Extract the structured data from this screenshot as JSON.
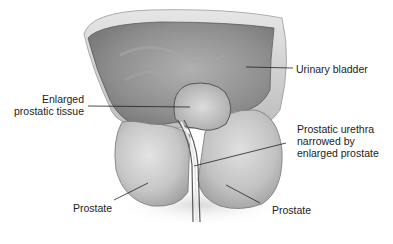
{
  "diagram": {
    "labels": {
      "urinary_bladder": "Urinary bladder",
      "enlarged_tissue_line1": "Enlarged",
      "enlarged_tissue_line2": "prostatic tissue",
      "urethra_line1": "Prostatic urethra",
      "urethra_line2": "narrowed by",
      "urethra_line3": "enlarged prostate",
      "prostate_left": "Prostate",
      "prostate_right": "Prostate"
    },
    "colors": {
      "background": "#ffffff",
      "bladder_interior": "#8a8a8a",
      "bladder_wall": "#c8c8c8",
      "prostate_lobe": "#c4c4c4",
      "outline": "#555555",
      "leader_line": "#222222",
      "text": "#222222"
    }
  }
}
